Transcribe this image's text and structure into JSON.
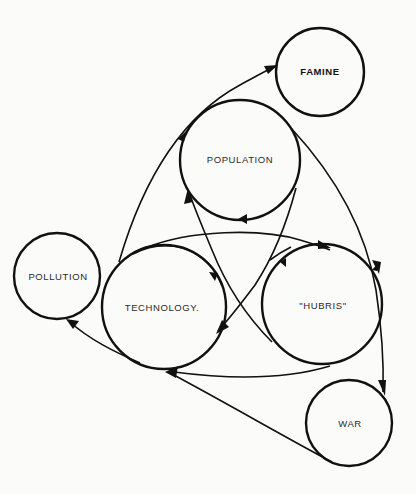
{
  "diagram": {
    "title": "",
    "nodes": {
      "famine": {
        "label": "FAMINE",
        "cx": 320,
        "cy": 72,
        "r": 44,
        "bold": true
      },
      "population": {
        "label": "POPULATION",
        "cx": 240,
        "cy": 160,
        "r": 60,
        "bold": false
      },
      "pollution": {
        "label": "POLLUTION",
        "cx": 57,
        "cy": 276,
        "r": 43,
        "bold": false
      },
      "technology": {
        "label": "TECHNOLOGY.",
        "cx": 164,
        "cy": 307,
        "r": 62,
        "bold": false
      },
      "hubris": {
        "label": "\"HUBRIS\"",
        "cx": 322,
        "cy": 304,
        "r": 60,
        "bold": false
      },
      "war": {
        "label": "WAR",
        "cx": 349,
        "cy": 423,
        "r": 43,
        "bold": false
      }
    },
    "edges": [
      {
        "from": "technology",
        "to": "famine",
        "note": "arc from technology up past population to famine"
      },
      {
        "from": "technology",
        "to": "population",
        "note": "arrow into population lower-left"
      },
      {
        "from": "population",
        "to": "war",
        "note": "long arc along right side down to war"
      },
      {
        "from": "population",
        "to": "population",
        "note": "arrow on lower edge of population (feedback)"
      },
      {
        "from": "population",
        "to": "technology",
        "note": "arrow into technology upper-right"
      },
      {
        "from": "population",
        "to": "technology",
        "note": "crossing line into technology lower-right"
      },
      {
        "from": "technology",
        "to": "hubris",
        "note": "arc over top from technology to hubris"
      },
      {
        "from": "technology",
        "to": "hubris",
        "note": "crossing line into hubris upper-left"
      },
      {
        "from": "hubris",
        "to": "technology",
        "note": "bottom arc from hubris back to technology"
      },
      {
        "from": "technology",
        "to": "pollution",
        "note": "arc to pollution"
      },
      {
        "from": "war",
        "to": "technology",
        "note": "line from war back to technology"
      }
    ]
  }
}
